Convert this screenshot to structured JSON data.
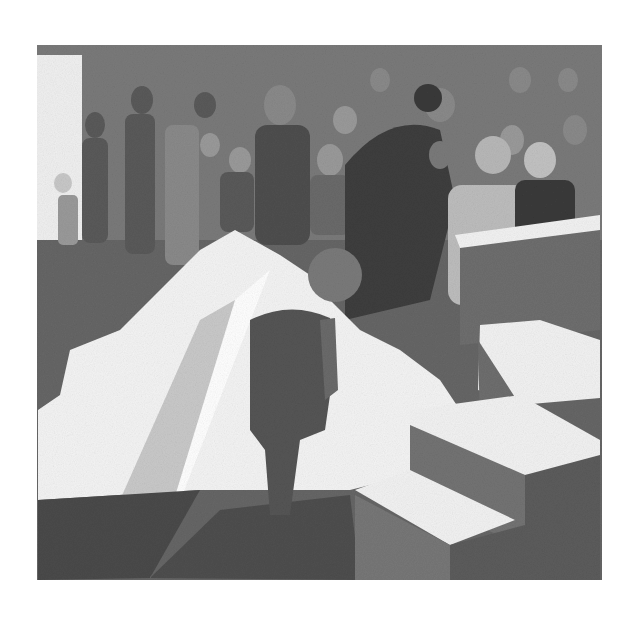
{
  "artwork": {
    "medium": "graphite pencil illustration",
    "palette": {
      "paper": "#ffffff",
      "wall": "#7a7a7a",
      "floor_dark": "#555555",
      "light": "#f4f4f4",
      "figure_dark": "#4a4a4a",
      "figure_mid": "#8a8a8a",
      "step_side": "#6e6e6e",
      "step_top": "#f2f2f2"
    },
    "scene": {
      "background": "crowd of people in a hall",
      "foreground_figure": "small bald boy seen from behind",
      "right": "white staircase with three steps",
      "light_beams": "white diagonal shapes of light on floor"
    }
  }
}
